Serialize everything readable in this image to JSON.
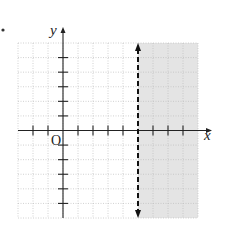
{
  "item_marker": "•",
  "chart_data": {
    "type": "inequality-graph",
    "title": "",
    "xlabel": "x",
    "ylabel": "y",
    "origin_label": "O",
    "xlim": [
      -3,
      9
    ],
    "ylim": [
      -6,
      6
    ],
    "grid": true,
    "x_ticks": [
      -2,
      -1,
      1,
      2,
      3,
      4,
      6,
      7,
      8
    ],
    "y_ticks": [
      -5,
      -4,
      -3,
      -2,
      -1,
      1,
      2,
      3,
      4,
      5
    ],
    "boundary": {
      "equation": "x = 5",
      "style": "dashed",
      "arrows": "both"
    },
    "shaded_region": "x > 5",
    "inequality": "x > 5",
    "colors": {
      "shade": "#e4e4e4",
      "grid": "#bdbdbd",
      "axis": "#222222",
      "boundary": "#111111"
    }
  }
}
